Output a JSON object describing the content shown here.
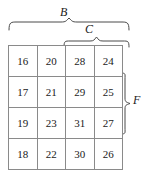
{
  "figure": {
    "kind": "number-grid-with-braces",
    "grid": {
      "rows": [
        [
          "16",
          "20",
          "28",
          "24"
        ],
        [
          "17",
          "21",
          "29",
          "25"
        ],
        [
          "19",
          "23",
          "31",
          "27"
        ],
        [
          "18",
          "22",
          "30",
          "26"
        ]
      ]
    },
    "braces": {
      "b": {
        "label": "B",
        "orientation": "top",
        "spans_columns": "1-4"
      },
      "c": {
        "label": "C",
        "orientation": "top",
        "spans_columns": "3-4"
      },
      "f": {
        "label": "F",
        "orientation": "right",
        "spans_rows": "2-3"
      }
    },
    "colors": {
      "grid_line": "#8a8a8a",
      "text": "#1a1a1a",
      "brace_stroke": "#4a4a4a",
      "background": "#ffffff"
    }
  }
}
